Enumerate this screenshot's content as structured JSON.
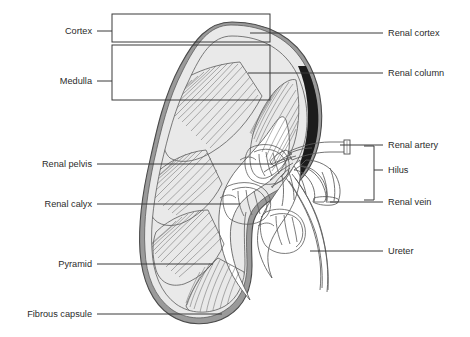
{
  "figure": {
    "background_color": "#ffffff"
  },
  "colors": {
    "cortex_fill": "#e9e9e9",
    "medulla_fill": "#ededed",
    "pelvis_fill": "#ffffff",
    "capsule_rim": "#9a9a9a",
    "dark_crescent": "#1c1c1c",
    "outline_stroke": "#4a4a4a",
    "leader_stroke": "#3a3a3a",
    "text_color": "#2b2b2b",
    "striation_stroke": "#6e6e6e"
  },
  "labels_left": [
    {
      "id": "cortex",
      "text": "Cortex",
      "text_x": 92,
      "text_y": 34,
      "leader_x1": 97,
      "leader_x2": 112,
      "leader_y": 31
    },
    {
      "id": "medulla",
      "text": "Medulla",
      "text_x": 92,
      "text_y": 84,
      "leader_x1": 97,
      "leader_x2": 112,
      "leader_y": 81
    },
    {
      "id": "renal-pelvis",
      "text": "Renal pelvis",
      "text_x": 92,
      "text_y": 167,
      "leader_x1": 97,
      "leader_x2": 272,
      "leader_y": 164
    },
    {
      "id": "renal-calyx",
      "text": "Renal calyx",
      "text_x": 92,
      "text_y": 207,
      "leader_x1": 97,
      "leader_x2": 240,
      "leader_y": 204
    },
    {
      "id": "pyramid",
      "text": "Pyramid",
      "text_x": 92,
      "text_y": 267,
      "leader_x1": 97,
      "leader_x2": 213,
      "leader_y": 264
    },
    {
      "id": "fibrous-capsule",
      "text": "Fibrous capsule",
      "text_x": 92,
      "text_y": 317,
      "leader_x1": 97,
      "leader_x2": 222,
      "leader_y": 314
    }
  ],
  "labels_right": [
    {
      "id": "renal-cortex",
      "text": "Renal cortex",
      "text_x": 388,
      "text_y": 36,
      "leader_x1": 250,
      "leader_x2": 383,
      "leader_y": 33
    },
    {
      "id": "renal-column",
      "text": "Renal column",
      "text_x": 388,
      "text_y": 76,
      "leader_x1": 248,
      "leader_x2": 383,
      "leader_y": 73
    },
    {
      "id": "renal-artery",
      "text": "Renal artery",
      "text_x": 388,
      "text_y": 148,
      "leader_x1": 340,
      "leader_x2": 383,
      "leader_y": 145
    },
    {
      "id": "hilus",
      "text": "Hilus",
      "text_x": 388,
      "text_y": 173,
      "leader_x1": 374,
      "leader_x2": 383,
      "leader_y": 170
    },
    {
      "id": "renal-vein",
      "text": "Renal vein",
      "text_x": 388,
      "text_y": 205,
      "leader_x1": 330,
      "leader_x2": 383,
      "leader_y": 202
    },
    {
      "id": "ureter",
      "text": "Ureter",
      "text_x": 388,
      "text_y": 254,
      "leader_x1": 310,
      "leader_x2": 383,
      "leader_y": 251
    }
  ],
  "brackets": {
    "cortex_box": {
      "x": 112,
      "y": 14,
      "width": 158,
      "height": 28
    },
    "medulla_box": {
      "x": 112,
      "y": 45,
      "width": 158,
      "height": 55
    },
    "hilus_bracket": {
      "x": 374,
      "y_top": 146,
      "y_bottom": 200,
      "arm": 10
    }
  },
  "structures": [
    {
      "name": "fibrous-capsule",
      "description": "outer bean-shaped rim of kidney"
    },
    {
      "name": "renal-cortex",
      "description": "outer pale band beneath capsule"
    },
    {
      "name": "renal-medulla",
      "description": "inner region containing pyramids"
    },
    {
      "name": "renal-pyramid",
      "description": "triangular striated cones, 6 shown"
    },
    {
      "name": "renal-column",
      "description": "cortical tissue between pyramids"
    },
    {
      "name": "renal-papilla",
      "description": "apex of pyramid projecting into calyx"
    },
    {
      "name": "minor-calyx",
      "description": "cup surrounding papilla"
    },
    {
      "name": "renal-pelvis",
      "description": "funnel-shaped collecting chamber"
    },
    {
      "name": "renal-artery",
      "description": "vessel entering at hilus, upper"
    },
    {
      "name": "renal-vein",
      "description": "vessel leaving at hilus, lower"
    },
    {
      "name": "ureter",
      "description": "tube descending from pelvis"
    },
    {
      "name": "hilus",
      "description": "concave medial notch with vessels"
    }
  ]
}
